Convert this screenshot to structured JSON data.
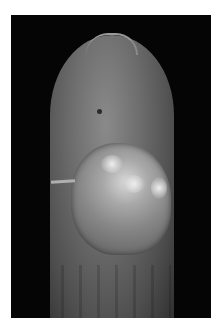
{
  "image": {
    "description": "Clinical photograph of a fingertip (dorsal view) with a raised, lobulated, pale lesion over the distal finger, edged by lifted skin, against a black background",
    "colors": {
      "background": "#050505",
      "border": "#ffffff",
      "skin": "#6e6e6e",
      "lesion_highlight": "#d8d8d8"
    }
  }
}
